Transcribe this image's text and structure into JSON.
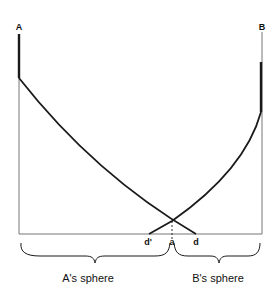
{
  "diagram": {
    "labels": {
      "left_endpoint": "A",
      "right_endpoint": "B",
      "d_prime": "d'",
      "a": "a",
      "d": "d",
      "left_sphere": "A's sphere",
      "right_sphere": "B's sphere"
    },
    "colors": {
      "ink": "#1a1a1a",
      "thin_line": "#555555",
      "background": "#ffffff"
    }
  }
}
